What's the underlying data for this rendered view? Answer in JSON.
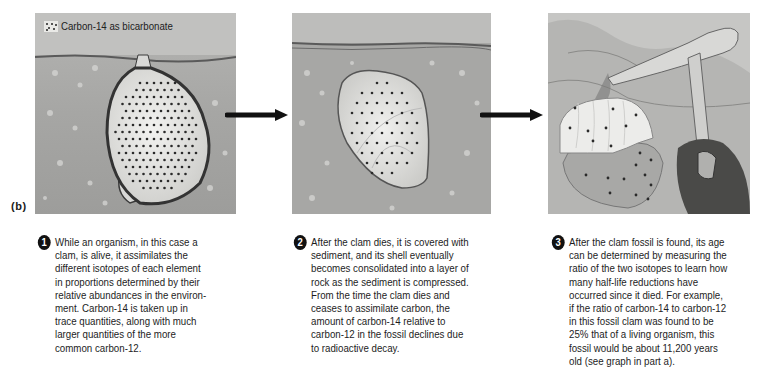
{
  "figure": {
    "part_label": "(b)",
    "legend": {
      "icon": "dotted-square-icon",
      "label": "Carbon-14 as bicarbonate"
    },
    "panels": [
      {
        "id": 1,
        "description": "Living clam in sediment with many carbon-14 dots"
      },
      {
        "id": 2,
        "description": "Buried clam shell in sediment with fewer carbon-14 dots"
      },
      {
        "id": 3,
        "description": "Fossil clam being excavated with rock hammer, few carbon-14 dots"
      }
    ],
    "arrows": [
      "right-arrow-icon",
      "right-arrow-icon"
    ],
    "captions": [
      {
        "number": "1",
        "lines": [
          "While an organism, in this case a",
          "clam, is alive, it assimilates the",
          "different isotopes of each element",
          "in proportions determined by their",
          "relative abundances in the environ-",
          "ment. Carbon-14 is taken up in",
          "trace quantities, along with much",
          "larger quantities of the more",
          "common carbon-12."
        ]
      },
      {
        "number": "2",
        "lines": [
          "After the clam dies, it is covered with",
          "sediment, and its shell eventually",
          "becomes consolidated into a layer of",
          "rock as the sediment is compressed.",
          "From the time the clam dies and",
          "ceases to assimilate carbon, the",
          "amount of carbon-14 relative to",
          "carbon-12 in the fossil declines due",
          "to radioactive decay."
        ]
      },
      {
        "number": "3",
        "lines": [
          "After the clam fossil is found, its age",
          "can be determined by measuring the",
          "ratio of the two isotopes to learn how",
          "many half-life reductions have",
          "occurred since it died. For example,",
          "if the ratio of carbon-14 to carbon-12",
          "in this fossil clam was found to be",
          "25% that of a living organism, this",
          "fossil would be about 11,200 years",
          "old (see graph in part a)."
        ]
      }
    ],
    "colors": {
      "sediment": "#a9a9a9",
      "shell": "#e4e4e2",
      "dot": "#2a2a2a",
      "arrow": "#111111"
    }
  }
}
